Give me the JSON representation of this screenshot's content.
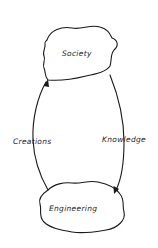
{
  "diagram": {
    "nodes": [
      {
        "id": "society",
        "label": "Society"
      },
      {
        "id": "engineering",
        "label": "Engineering"
      }
    ],
    "edges": [
      {
        "from": "society",
        "to": "engineering",
        "label": "Knowledge",
        "side": "right"
      },
      {
        "from": "engineering",
        "to": "society",
        "label": "Creations",
        "side": "left"
      }
    ],
    "colors": {
      "stroke": "#1a1a1a",
      "background": "#ffffff"
    }
  }
}
